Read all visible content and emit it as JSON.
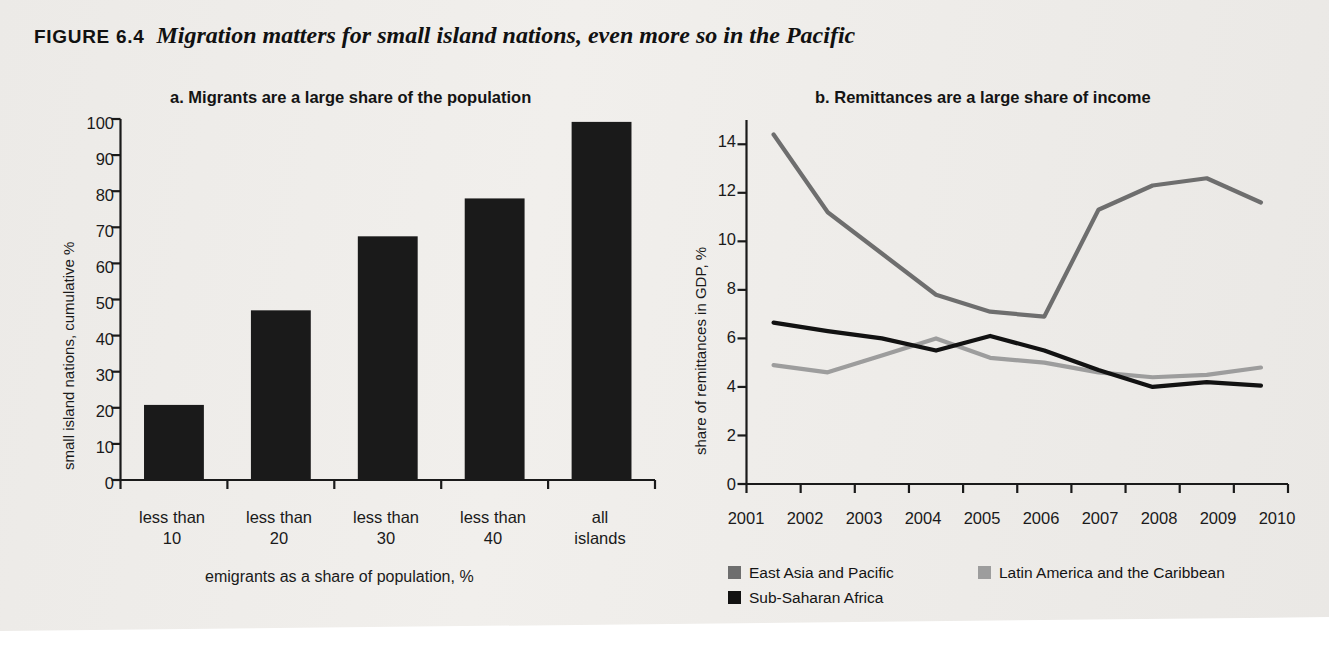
{
  "figure": {
    "label": "FIGURE 6.4",
    "title": "Migration matters for small island nations, even more so in the Pacific",
    "background_color": "#eeeeec"
  },
  "panel_a": {
    "title": "a.  Migrants are a large share of the population"
  },
  "panel_b": {
    "title": "b.  Remittances are a large share of income"
  },
  "chart_data": [
    {
      "type": "bar",
      "panel": "a",
      "title": "a.  Migrants are a large share of the population",
      "xlabel": "emigrants as a share of population, %",
      "ylabel": "small island nations, cumulative %",
      "categories": [
        "less than 10",
        "less than 20",
        "less than 30",
        "less than 40",
        "all islands"
      ],
      "category_lines": [
        [
          "less than",
          "10"
        ],
        [
          "less than",
          "20"
        ],
        [
          "less than",
          "30"
        ],
        [
          "less than",
          "40"
        ],
        [
          "all",
          "islands"
        ]
      ],
      "values": [
        20.8,
        47.0,
        67.5,
        78.0,
        99.2
      ],
      "ylim": [
        0,
        100
      ],
      "yticks": [
        0,
        10,
        20,
        30,
        40,
        50,
        60,
        70,
        80,
        90,
        100
      ],
      "grid": false,
      "bar_color": "#1a1a1a"
    },
    {
      "type": "line",
      "panel": "b",
      "title": "b.  Remittances are a large share of income",
      "xlabel": "",
      "ylabel": "share of remittances in GDP, %",
      "x": [
        "2001",
        "2002",
        "2003",
        "2004",
        "2005",
        "2006",
        "2007",
        "2008",
        "2009",
        "2010"
      ],
      "ylim": [
        0,
        15
      ],
      "yticks": [
        0,
        2,
        4,
        6,
        8,
        10,
        12,
        14
      ],
      "grid": false,
      "legend_position": "bottom",
      "series": [
        {
          "name": "East Asia and Pacific",
          "color": "#6e6e6e",
          "values": [
            14.4,
            11.2,
            9.5,
            7.8,
            7.1,
            6.9,
            11.3,
            12.3,
            12.6,
            11.6
          ]
        },
        {
          "name": "Latin America and the Caribbean",
          "color": "#9d9d9d",
          "values": [
            4.9,
            4.6,
            5.3,
            6.0,
            5.2,
            5.0,
            4.6,
            4.4,
            4.5,
            4.8
          ]
        },
        {
          "name": "Sub-Saharan Africa",
          "color": "#121212",
          "values": [
            6.65,
            6.3,
            6.0,
            5.5,
            6.1,
            5.5,
            4.7,
            4.0,
            4.2,
            4.05
          ]
        }
      ]
    }
  ]
}
